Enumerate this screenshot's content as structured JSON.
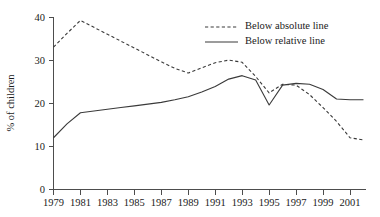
{
  "chart_data": {
    "type": "line",
    "title": "",
    "xlabel": "",
    "ylabel": "% of children",
    "xlim": [
      1979,
      2002
    ],
    "ylim": [
      0,
      40
    ],
    "grid": false,
    "legend_position": "top-right",
    "x_ticks": [
      "1979",
      "1981",
      "1983",
      "1985",
      "1987",
      "1989",
      "1991",
      "1993",
      "1995",
      "1997",
      "1999",
      "2001"
    ],
    "y_ticks": [
      "0",
      "10",
      "20",
      "30",
      "40"
    ],
    "x": [
      1979,
      1980,
      1981,
      1982,
      1983,
      1984,
      1985,
      1986,
      1987,
      1988,
      1989,
      1990,
      1991,
      1992,
      1993,
      1994,
      1995,
      1996,
      1997,
      1998,
      1999,
      2000,
      2001,
      2002
    ],
    "series": [
      {
        "name": "Below absolute line",
        "style": "dashed",
        "color": "#3a3a3a",
        "values": [
          33.0,
          36.2,
          39.2,
          37.6,
          36.0,
          34.4,
          32.8,
          31.2,
          29.6,
          28.1,
          27.0,
          28.2,
          29.4,
          30.0,
          29.5,
          26.2,
          22.4,
          24.4,
          24.2,
          22.0,
          19.0,
          15.8,
          12.0,
          11.5
        ]
      },
      {
        "name": "Below relative line",
        "style": "solid",
        "color": "#3a3a3a",
        "values": [
          12.0,
          15.2,
          17.8,
          18.2,
          18.6,
          19.0,
          19.4,
          19.8,
          20.2,
          20.8,
          21.5,
          22.6,
          23.9,
          25.6,
          26.4,
          25.4,
          19.6,
          24.2,
          24.6,
          24.4,
          23.2,
          21.0,
          20.8,
          20.8
        ]
      }
    ],
    "legend": [
      {
        "label": "Below absolute line",
        "style": "dashed"
      },
      {
        "label": "Below relative line",
        "style": "solid"
      }
    ]
  }
}
